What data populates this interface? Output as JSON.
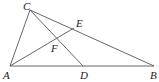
{
  "figure": {
    "type": "geometry",
    "points": {
      "A": {
        "label": "A",
        "x": 10,
        "y": 66
      },
      "B": {
        "label": "B",
        "x": 154,
        "y": 66
      },
      "C": {
        "label": "C",
        "x": 30,
        "y": 10
      },
      "D": {
        "label": "D",
        "x": 83,
        "y": 66
      },
      "E": {
        "label": "E",
        "x": 74,
        "y": 28
      },
      "F": {
        "label": "F",
        "x": 54,
        "y": 41
      }
    },
    "segments": [
      [
        "A",
        "B"
      ],
      [
        "A",
        "C"
      ],
      [
        "C",
        "B"
      ],
      [
        "C",
        "D"
      ],
      [
        "A",
        "E"
      ]
    ],
    "labels": {
      "A": "A",
      "B": "B",
      "C": "C",
      "D": "D",
      "E": "E",
      "F": "F"
    },
    "stroke_color": "#555555",
    "label_color": "#222222"
  }
}
